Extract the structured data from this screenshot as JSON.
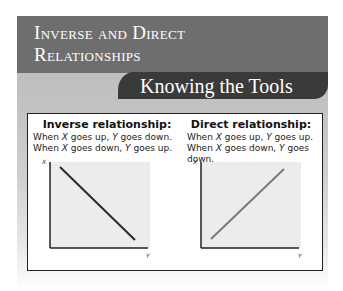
{
  "header": {
    "title_line1": "Inverse and Direct",
    "title_line2": "Relationships",
    "tab_label": "Knowing the Tools"
  },
  "inverse": {
    "heading": "Inverse relationship:",
    "line1_pre": "When ",
    "line1_x": "X",
    "line1_mid": " goes up, ",
    "line1_y": "Y",
    "line1_post": " goes down.",
    "line2_pre": "When ",
    "line2_x": "X",
    "line2_mid": " goes down, ",
    "line2_y": "Y",
    "line2_post": " goes up.",
    "y_axis_label": "X",
    "x_axis_label": "Y",
    "line_color": "#2a2a2a"
  },
  "direct": {
    "heading": "Direct relationship:",
    "line1_pre": "When ",
    "line1_x": "X",
    "line1_mid": " goes up, ",
    "line1_y": "Y",
    "line1_post": " goes up.",
    "line2_pre": "When ",
    "line2_x": "X",
    "line2_mid": " goes down, ",
    "line2_y": "Y",
    "line2_post": " goes down.",
    "y_axis_label": "X",
    "x_axis_label": "Y",
    "line_color": "#7a7a7a"
  },
  "colors": {
    "header_bg": "#6e6e6e",
    "tab_bg": "#3a3a3a",
    "plot_bg": "#ececec"
  }
}
